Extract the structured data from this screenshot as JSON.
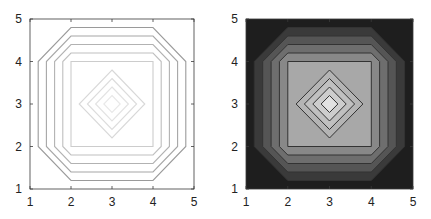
{
  "chart_data": [
    {
      "type": "contour",
      "title": "",
      "xlabel": "",
      "ylabel": "",
      "xlim": [
        1,
        5
      ],
      "ylim": [
        1,
        5
      ],
      "xticks": [
        "1",
        "2",
        "3",
        "4",
        "5"
      ],
      "yticks": [
        "1",
        "2",
        "3",
        "4",
        "5"
      ],
      "grid": false,
      "filled": false,
      "octagon_levels": [
        {
          "offset": 1.2,
          "color": "#9a9a9a"
        },
        {
          "offset": 1.4,
          "color": "#a6a6a6"
        },
        {
          "offset": 1.6,
          "color": "#b2b2b2"
        },
        {
          "offset": 1.8,
          "color": "#bfbfbf"
        },
        {
          "offset": 2.0,
          "color": "#cccccc"
        }
      ],
      "diamond_levels": [
        {
          "center": [
            3,
            3
          ],
          "radius": 0.8,
          "color": "#d8d8d8"
        },
        {
          "center": [
            3,
            3
          ],
          "radius": 0.6,
          "color": "#dcdcdc"
        },
        {
          "center": [
            3,
            3
          ],
          "radius": 0.4,
          "color": "#e2e2e2"
        },
        {
          "center": [
            3,
            3
          ],
          "radius": 0.2,
          "color": "#e8e8e8"
        }
      ]
    },
    {
      "type": "contourf",
      "title": "",
      "xlabel": "",
      "ylabel": "",
      "xlim": [
        1,
        5
      ],
      "ylim": [
        1,
        5
      ],
      "xticks": [
        "1",
        "2",
        "3",
        "4",
        "5"
      ],
      "yticks": [
        "1",
        "2",
        "3",
        "4",
        "5"
      ],
      "grid": false,
      "filled": true,
      "background_color": "#1e1e1e",
      "octagon_levels": [
        {
          "offset": 1.2,
          "color": "#3a3a3a"
        },
        {
          "offset": 1.4,
          "color": "#555555"
        },
        {
          "offset": 1.6,
          "color": "#6e6e6e"
        },
        {
          "offset": 1.8,
          "color": "#888888"
        },
        {
          "offset": 2.0,
          "color": "#a8a8a8"
        }
      ],
      "diamond_levels": [
        {
          "center": [
            3,
            3
          ],
          "radius": 0.8,
          "color": "#b4b4b4"
        },
        {
          "center": [
            3,
            3
          ],
          "radius": 0.6,
          "color": "#c0c0c0"
        },
        {
          "center": [
            3,
            3
          ],
          "radius": 0.4,
          "color": "#cdcdcd"
        },
        {
          "center": [
            3,
            3
          ],
          "radius": 0.2,
          "color": "#e2e2e2"
        }
      ],
      "line_color": "#333333"
    }
  ],
  "axes": [
    {
      "left": 30,
      "top": 19,
      "right": 194,
      "bottom": 189
    },
    {
      "left": 246,
      "top": 19,
      "right": 413,
      "bottom": 189
    }
  ]
}
